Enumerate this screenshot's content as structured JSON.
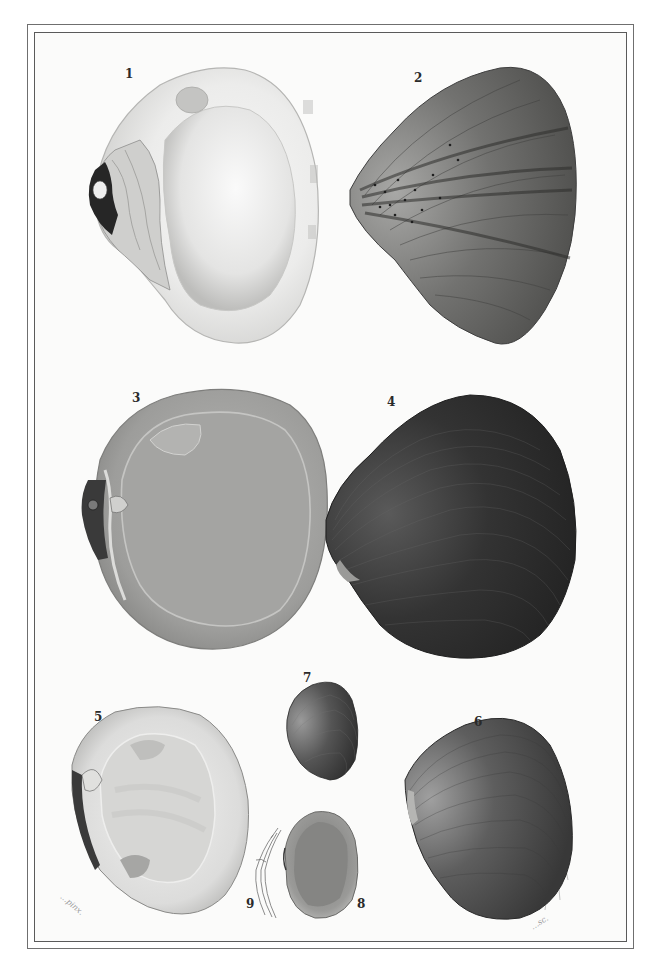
{
  "plate": {
    "type": "natural history engraving plate",
    "subject": "bivalve shells",
    "background_color": "#fbfbfa",
    "frame_color": "#5a5a5a"
  },
  "figures": [
    {
      "number": "1",
      "label": "1",
      "view": "interior valve",
      "tone": "light",
      "color": "#d9d9d7"
    },
    {
      "number": "2",
      "label": "2",
      "view": "exterior valve with radial bands",
      "tone": "medium-dark",
      "color": "#6a6a68"
    },
    {
      "number": "3",
      "label": "3",
      "view": "interior valve",
      "tone": "medium",
      "color": "#a9a9a7"
    },
    {
      "number": "4",
      "label": "4",
      "view": "exterior valve",
      "tone": "dark",
      "color": "#2e2e2e"
    },
    {
      "number": "5",
      "label": "5",
      "view": "interior valve",
      "tone": "light",
      "color": "#d2d2d0"
    },
    {
      "number": "6",
      "label": "6",
      "view": "exterior valve",
      "tone": "dark",
      "color": "#4a4a4a"
    },
    {
      "number": "7",
      "label": "7",
      "view": "small exterior valve",
      "tone": "dark",
      "color": "#454545"
    },
    {
      "number": "8",
      "label": "8",
      "view": "small interior valve",
      "tone": "medium",
      "color": "#8c8c8a"
    },
    {
      "number": "9",
      "label": "9",
      "view": "hinge detail",
      "tone": "line",
      "color": "#777777"
    }
  ],
  "signatures": {
    "left": "…pinx.",
    "right": "…sc."
  }
}
